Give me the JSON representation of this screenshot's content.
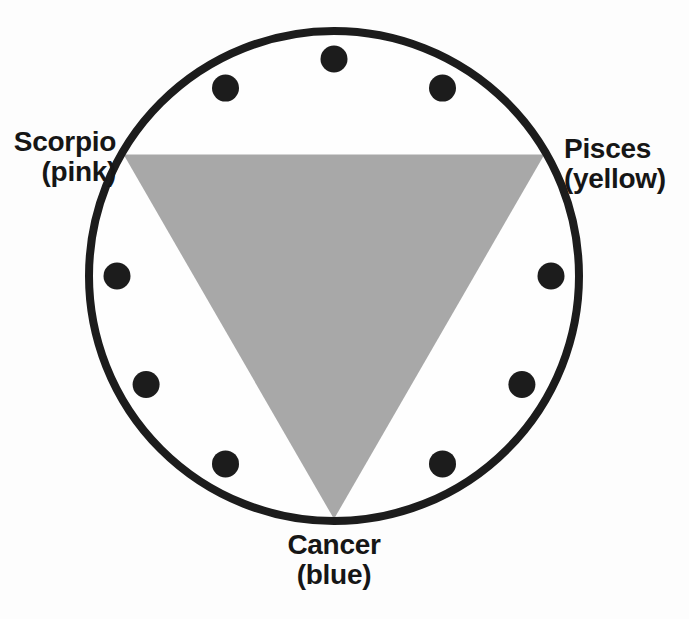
{
  "figure": {
    "type": "zodiac-grand-trine-diagram",
    "background": "#fdfdfd",
    "circle": {
      "cx": 334,
      "cy": 276,
      "r": 245,
      "fill": "#fefefe",
      "stroke": "#1c1c1c",
      "stroke_width": 8
    },
    "triangle": {
      "fill": "#a8a8a8",
      "vertex_radius": 243,
      "vertices": [
        {
          "sign": "Scorpio",
          "angle_deg": 150
        },
        {
          "sign": "Pisces",
          "angle_deg": 30
        },
        {
          "sign": "Cancer",
          "angle_deg": 270
        }
      ]
    },
    "dots": {
      "fill": "#1c1c1c",
      "dot_radius": 13.5,
      "ring_radius": 217,
      "angles_deg": [
        0,
        60,
        90,
        120,
        180,
        210,
        240,
        300,
        330
      ]
    }
  },
  "labels": {
    "scorpio": {
      "name": "Scorpio",
      "color": "(pink)"
    },
    "pisces": {
      "name": "Pisces",
      "color": "(yellow)"
    },
    "cancer": {
      "name": "Cancer",
      "color": "(blue)"
    }
  }
}
